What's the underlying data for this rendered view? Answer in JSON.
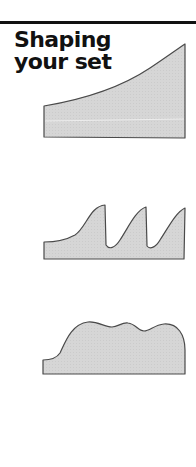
{
  "heading": {
    "line1": "Shaping",
    "line2": "your set"
  },
  "colors": {
    "rule": "#111111",
    "text": "#111111",
    "shape_fill": "#d4d4d4",
    "shape_stroke": "#4a4a4a",
    "background": "#ffffff"
  },
  "shapes": [
    {
      "name": "rising-ramp-shape",
      "description": "Shape rising gradually from left to a high right edge"
    },
    {
      "name": "sawtooth-shape",
      "description": "Shape with three sawtooth peaks"
    },
    {
      "name": "rolling-hills-shape",
      "description": "Shape with a low left step and three rounded humps"
    }
  ]
}
